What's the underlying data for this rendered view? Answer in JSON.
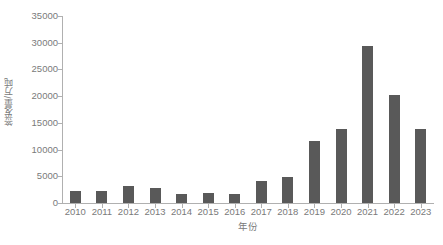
{
  "chart_data": {
    "type": "bar",
    "title": "",
    "xlabel": "年份",
    "ylabel": "签发量/万吨",
    "categories": [
      "2010",
      "2011",
      "2012",
      "2013",
      "2014",
      "2015",
      "2016",
      "2017",
      "2018",
      "2019",
      "2020",
      "2021",
      "2022",
      "2023"
    ],
    "values": [
      2300,
      2300,
      3200,
      2750,
      1650,
      1950,
      1750,
      4200,
      4800,
      11700,
      13900,
      29400,
      20200,
      13800
    ],
    "series": [
      {
        "name": "签发量",
        "values": [
          2300,
          2300,
          3200,
          2750,
          1650,
          1950,
          1750,
          4200,
          4800,
          11700,
          13900,
          29400,
          20200,
          13800
        ]
      }
    ],
    "ylim": [
      0,
      35000
    ],
    "ytick_labels": [
      "0",
      "5000",
      "10000",
      "15000",
      "20000",
      "25000",
      "30000",
      "35000"
    ],
    "ytick_values": [
      0,
      5000,
      10000,
      15000,
      20000,
      25000,
      30000,
      35000
    ],
    "grid": false,
    "legend": "none",
    "bar_color": "#595959",
    "axis_color": "#b0b0b0",
    "text_color": "#7a7a7a",
    "background_color": "#ffffff"
  }
}
